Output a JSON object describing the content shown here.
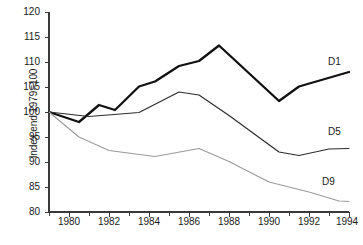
{
  "chart_data": {
    "type": "line",
    "title": "",
    "xlabel": "",
    "ylabel": "Index end 1979=100",
    "xlim": [
      1979,
      1994
    ],
    "ylim": [
      80,
      120
    ],
    "yticks": [
      80,
      85,
      90,
      95,
      100,
      105,
      110,
      115,
      120
    ],
    "xticks": [
      1980,
      1982,
      1984,
      1986,
      1988,
      1990,
      1992,
      1994
    ],
    "x_minor_tick_step": 1,
    "grid": false,
    "legend_position": "right-inline",
    "series": [
      {
        "name": "D1",
        "color": "#111111",
        "width": 2.3,
        "x": [
          1979,
          1980.5,
          1981.5,
          1982.3,
          1983.5,
          1984.3,
          1985.5,
          1986.5,
          1987.5,
          1990.5,
          1991.5,
          1994
        ],
        "values": [
          100.0,
          98.0,
          101.4,
          100.4,
          105.1,
          106.1,
          109.2,
          110.2,
          113.3,
          102.2,
          105.1,
          108.0
        ]
      },
      {
        "name": "D5",
        "color": "#2c2c2c",
        "width": 1.2,
        "x": [
          1979,
          1981,
          1983.5,
          1985.5,
          1986.5,
          1988,
          1990.5,
          1991.5,
          1993,
          1994
        ],
        "values": [
          100.0,
          99.1,
          99.9,
          104.0,
          103.4,
          99.3,
          92.0,
          91.3,
          92.6,
          92.7
        ]
      },
      {
        "name": "D9",
        "color": "#9a9a9a",
        "width": 1.1,
        "x": [
          1979,
          1980.5,
          1982,
          1984.3,
          1986.5,
          1988,
          1990,
          1992,
          1993.5,
          1994
        ],
        "values": [
          100.0,
          95.0,
          92.3,
          91.1,
          92.7,
          90.1,
          86.0,
          84.0,
          82.2,
          82.1
        ]
      }
    ]
  },
  "axis": {
    "ylabel_text": "Index end 1979=100",
    "ytick_labels": [
      "120",
      "115",
      "110",
      "105",
      "100",
      "95",
      "90",
      "85",
      "80"
    ],
    "xtick_labels": [
      "1980",
      "1982",
      "1984",
      "1986",
      "1988",
      "1990",
      "1992",
      "1994"
    ]
  },
  "series_labels": {
    "d1": "D1",
    "d5": "D5",
    "d9": "D9"
  }
}
